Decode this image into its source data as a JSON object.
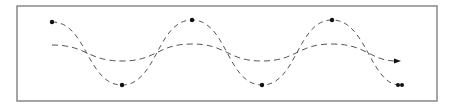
{
  "diagram": {
    "type": "wave-comparison",
    "frame": {
      "x": 17,
      "y": 6,
      "width": 420,
      "height": 95,
      "stroke": "#888888"
    },
    "colors": {
      "line": "#555555",
      "marker": "#111111"
    },
    "waves": [
      {
        "name": "high-amplitude-wave",
        "dash": "5,4",
        "path": "M52,22 C87,22 87,85 122,85 C157,85 157,20 192,20 C227,20 227,85 262,85 C297,85 297,20 332,20 C367,20 370,85 400,85",
        "markers": [
          [
            52,
            22
          ],
          [
            122,
            85
          ],
          [
            192,
            20
          ],
          [
            262,
            85
          ],
          [
            332,
            20
          ]
        ],
        "end": "double-dot"
      },
      {
        "name": "low-amplitude-wave",
        "dash": "6,4",
        "path": "M52,45 C87,45 87,61 122,61 C157,61 157,44 192,44 C227,44 227,61 262,61 C297,61 297,44 332,44 C367,44 370,61 396,61",
        "end": "arrow"
      }
    ]
  }
}
